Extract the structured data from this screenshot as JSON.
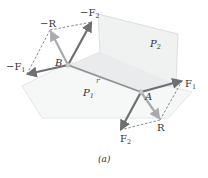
{
  "figure": {
    "caption": "(a)",
    "colors": {
      "background": "#ffffff",
      "plane_fill": "#f1f2f2",
      "plane_edge": "#d9dbdc",
      "force_arrow": "#6d6f72",
      "resultant_arrow": "#a9abae",
      "dashed_line": "#555555",
      "r_line": "#8e9093",
      "label": "#333333"
    },
    "points": {
      "B": {
        "label": "B",
        "x": 68,
        "y": 65
      },
      "A": {
        "label": "A",
        "x": 141,
        "y": 92
      }
    },
    "planes": [
      {
        "name": "P2",
        "label": "P",
        "subscript": "2"
      },
      {
        "name": "P1",
        "label": "P",
        "subscript": "1"
      }
    ],
    "position_vector": {
      "label": "r"
    },
    "vectors_at_B": [
      {
        "name": "-F1",
        "prefix": "−",
        "label": "F",
        "subscript": "1"
      },
      {
        "name": "-F2",
        "prefix": "−",
        "label": "F",
        "subscript": "2"
      },
      {
        "name": "-R",
        "prefix": "−",
        "label": "R",
        "subscript": ""
      }
    ],
    "vectors_at_A": [
      {
        "name": "F1",
        "prefix": "",
        "label": "F",
        "subscript": "1"
      },
      {
        "name": "F2",
        "prefix": "",
        "label": "F",
        "subscript": "2"
      },
      {
        "name": "R",
        "prefix": "",
        "label": "R",
        "subscript": ""
      }
    ]
  }
}
